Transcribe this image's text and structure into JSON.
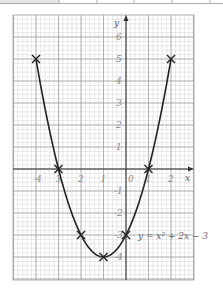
{
  "top_table": {
    "dividers_x": [
      59,
      97,
      134,
      172,
      210
    ],
    "first_cell_fill": "#e6e6e6",
    "line_color": "#9a9a9a"
  },
  "chart_data": {
    "type": "line",
    "title": "",
    "xlabel": "x",
    "ylabel": "y",
    "xlim": [
      -4.5,
      3
    ],
    "ylim": [
      -5,
      6.5
    ],
    "grid": true,
    "x_ticks": [
      -4,
      -3,
      -2,
      -1,
      0,
      1,
      2
    ],
    "x_tick_labels": [
      "-4",
      "3",
      "2",
      "1",
      "0",
      "1",
      "2"
    ],
    "y_ticks": [
      6,
      5,
      4,
      3,
      2,
      1,
      -1,
      -2,
      -3,
      -4
    ],
    "y_tick_labels": [
      "6",
      "5",
      "4",
      "3",
      "2",
      "1",
      "-1",
      "-2",
      "-3",
      "-4"
    ],
    "series": [
      {
        "name": "y = x² + 2x − 3",
        "function": "x^2 + 2x - 3",
        "domain": [
          -4,
          2
        ],
        "points": [
          {
            "x": -4,
            "y": 5
          },
          {
            "x": -3,
            "y": 0
          },
          {
            "x": -2,
            "y": -3
          },
          {
            "x": -1,
            "y": -4
          },
          {
            "x": 0,
            "y": -3
          },
          {
            "x": 1,
            "y": 0
          },
          {
            "x": 2,
            "y": 5
          }
        ],
        "marker": "x",
        "color": "#222222"
      }
    ],
    "annotations": [
      {
        "text": "y = x² + 2x − 3",
        "x": 0.5,
        "y": -3
      }
    ],
    "colors": {
      "major_grid": "#9c9c9c",
      "minor_grid": "#d2d2d2",
      "axis": "#333333",
      "curve": "#222222"
    }
  },
  "labels": {
    "x_axis": "x",
    "y_axis": "y",
    "equation": "y = x² + 2x − 3",
    "origin": "0"
  }
}
